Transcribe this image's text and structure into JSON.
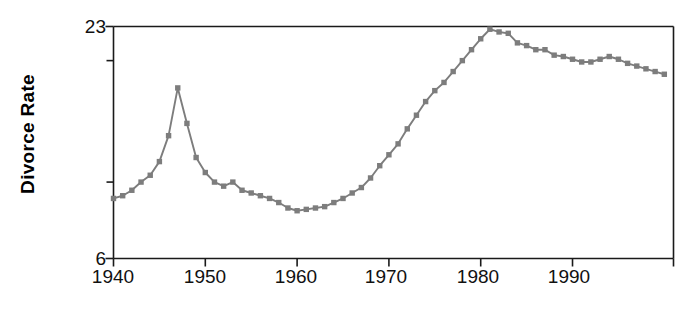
{
  "chart_data": {
    "type": "line",
    "title": "",
    "xlabel": "",
    "ylabel": "Divorce Rate",
    "xlim": [
      1940,
      2001
    ],
    "ylim": [
      6,
      23
    ],
    "grid": false,
    "legend": null,
    "marker": "square",
    "series_color": "#7d7d7d",
    "axis_color": "#1a1a1a",
    "y_tick_labels": [
      "23",
      "6"
    ],
    "y_tick_values": [
      23,
      6
    ],
    "y_minor_tick_values": [
      20.5,
      11.6
    ],
    "x_tick_labels": [
      "1940",
      "1950",
      "1960",
      "1970",
      "1980",
      "1990"
    ],
    "x_tick_values": [
      1940,
      1950,
      1960,
      1970,
      1980,
      1990
    ],
    "x": [
      1940,
      1941,
      1942,
      1943,
      1944,
      1945,
      1946,
      1947,
      1948,
      1949,
      1950,
      1951,
      1952,
      1953,
      1954,
      1955,
      1956,
      1957,
      1958,
      1959,
      1960,
      1961,
      1962,
      1963,
      1964,
      1965,
      1966,
      1967,
      1968,
      1969,
      1970,
      1971,
      1972,
      1973,
      1974,
      1975,
      1976,
      1977,
      1978,
      1979,
      1980,
      1981,
      1982,
      1983,
      1984,
      1985,
      1986,
      1987,
      1988,
      1989,
      1990,
      1991,
      1992,
      1993,
      1994,
      1995,
      1996,
      1997,
      1998,
      1999,
      2000
    ],
    "values": [
      10.4,
      10.6,
      11.0,
      11.6,
      12.1,
      13.1,
      15.0,
      18.5,
      15.9,
      13.4,
      12.3,
      11.6,
      11.3,
      11.6,
      11.0,
      10.8,
      10.6,
      10.4,
      10.1,
      9.7,
      9.5,
      9.6,
      9.7,
      9.8,
      10.1,
      10.4,
      10.8,
      11.2,
      11.9,
      12.8,
      13.6,
      14.4,
      15.5,
      16.5,
      17.5,
      18.3,
      18.9,
      19.7,
      20.5,
      21.3,
      22.1,
      22.8,
      22.6,
      22.5,
      21.8,
      21.6,
      21.3,
      21.3,
      20.9,
      20.8,
      20.6,
      20.4,
      20.4,
      20.6,
      20.8,
      20.6,
      20.3,
      20.1,
      19.9,
      19.7,
      19.5
    ]
  },
  "axis": {
    "ylabel_text": "Divorce Rate",
    "ytop_label": "23",
    "ybottom_label": "6",
    "xticks": [
      {
        "label": "1940"
      },
      {
        "label": "1950"
      },
      {
        "label": "1960"
      },
      {
        "label": "1970"
      },
      {
        "label": "1980"
      },
      {
        "label": "1990"
      }
    ]
  }
}
